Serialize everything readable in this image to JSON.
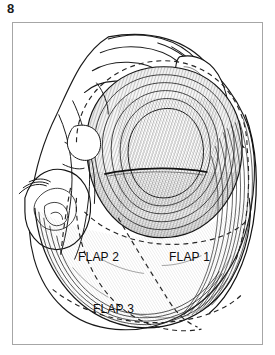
{
  "figure": {
    "number": "8",
    "plate_border_color": "#a6a6a6",
    "background_color": "#ffffff",
    "ink_color": "#111111"
  },
  "illustration": {
    "kind": "anatomical-line-drawing",
    "subject": "ear canal with tympanomeatal flaps",
    "style": "pen-and-ink hatching",
    "dashed_line_color": "#2a2a2a"
  },
  "labels": {
    "flap1": "FLAP 1",
    "flap2": "FLAP 2",
    "flap3": "FLAP 3"
  }
}
